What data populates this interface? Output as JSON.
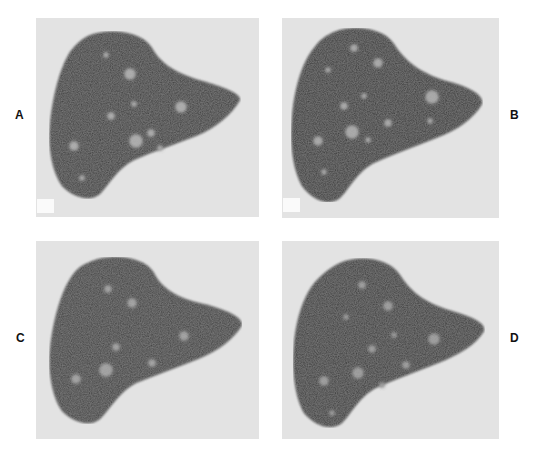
{
  "figure": {
    "panels": [
      {
        "id": "A",
        "label": "A",
        "label_side": "left",
        "has_marker": true
      },
      {
        "id": "B",
        "label": "B",
        "label_side": "right",
        "has_marker": true
      },
      {
        "id": "C",
        "label": "C",
        "label_side": "left",
        "has_marker": false
      },
      {
        "id": "D",
        "label": "D",
        "label_side": "right",
        "has_marker": false
      }
    ]
  },
  "colors": {
    "background": "#ffffff",
    "panel_bg": "#e3e3e3",
    "organ": "#3a3a3a",
    "lesion": "#a0a0a0"
  }
}
